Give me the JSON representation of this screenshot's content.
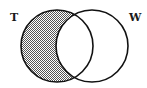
{
  "diagram": {
    "type": "venn",
    "sets": [
      {
        "id": "T",
        "label": "T",
        "cx": 57,
        "cy": 46,
        "r": 36
      },
      {
        "id": "W",
        "label": "W",
        "cx": 92,
        "cy": 46,
        "r": 36
      }
    ],
    "shaded_region": "T minus W",
    "shading_pattern": "dotted-gray",
    "colors": {
      "stroke": "#111111",
      "shade_dark": "#555555",
      "shade_light": "#ffffff",
      "background": "#ffffff"
    }
  }
}
